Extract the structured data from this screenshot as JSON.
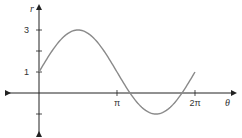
{
  "chart_data": {
    "type": "line",
    "title": "",
    "function": "r = 1 + 2 sin θ",
    "xlabel": "θ",
    "ylabel": "r",
    "x_ticks": [
      {
        "value": 3.14159,
        "label": "π"
      },
      {
        "value": 6.28318,
        "label": "2π"
      }
    ],
    "y_ticks": [
      {
        "value": 1,
        "label": "1"
      },
      {
        "value": 2,
        "label": ""
      },
      {
        "value": 3,
        "label": "3"
      },
      {
        "value": -1,
        "label": ""
      }
    ],
    "xlim": [
      -1.2,
      7.9
    ],
    "ylim": [
      -1.9,
      3.8
    ],
    "grid": false,
    "legend": null,
    "series": [
      {
        "name": "r = 1 + 2 sin θ",
        "x": [
          0,
          0.5236,
          1.0472,
          1.5708,
          2.0944,
          2.618,
          3.1416,
          3.6652,
          4.1888,
          4.7124,
          5.236,
          5.7596,
          6.2832
        ],
        "values": [
          1,
          2,
          2.732,
          3,
          2.732,
          2,
          1,
          0,
          -0.732,
          -1,
          -0.732,
          0,
          1
        ]
      }
    ],
    "color": "#8a8a8a",
    "axis_color": "#222222"
  }
}
